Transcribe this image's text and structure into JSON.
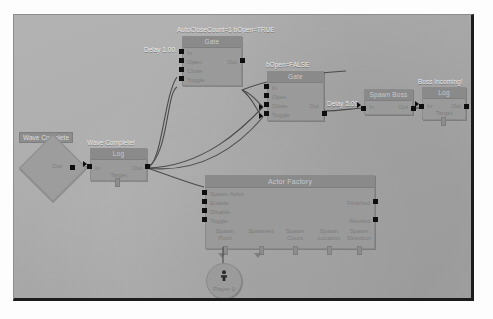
{
  "app": {
    "title": "Kismet Visual Script Graph",
    "canvas_bg": "#a8a8a8",
    "node_bg": "#9a9a9a",
    "node_header_bg": "#8a8a8a",
    "pin_color": "#0e0e0e",
    "wire_color": "#4b4b4b",
    "label_color": "#e9e9e9"
  },
  "comments": {
    "auto_close": "AutoCloseCount=1 bOpen=TRUE",
    "bopen_false": "bOpen=FALSE",
    "delay_1": "Delay 1.00",
    "delay_5": "Delay 5.00",
    "boss_incoming": "Boss Incoming!",
    "wave_complete_log": "Wave Complete!",
    "wave_complete_event": "Wave Complete"
  },
  "nodes": {
    "wave_complete_event": {
      "title": "Wave Complete",
      "out_label": "Out"
    },
    "wave_complete_log": {
      "title": "Log",
      "comment": "Wave Complete!",
      "in_label": "In",
      "out_label": "Out",
      "target_label": "Target"
    },
    "gate_a": {
      "title": "Gate",
      "comment": "AutoCloseCount=1 bOpen=TRUE",
      "inputs": [
        "In",
        "Open",
        "Close",
        "Toggle"
      ],
      "out_label": "Out"
    },
    "gate_b": {
      "title": "Gate",
      "comment": "bOpen=FALSE",
      "inputs": [
        "In",
        "Open",
        "Close",
        "Toggle"
      ],
      "out_label": "Out"
    },
    "spawn_boss": {
      "title": "Spawn Boss",
      "in_label": "In",
      "out_label": "Out"
    },
    "boss_log": {
      "title": "Log",
      "comment": "Boss Incoming!",
      "in_label": "In",
      "out_label": "Out",
      "target_label": "Target"
    },
    "actor_factory": {
      "title": "Actor Factory",
      "inputs": [
        "Spawn Actor",
        "Enable",
        "Disable",
        "Toggle"
      ],
      "outputs": [
        "Finished",
        "Aborted"
      ],
      "variables": [
        "Spawn Point",
        "Spawned",
        "Spawn Count",
        "Spawn Location",
        "Spawn Direction"
      ]
    },
    "player_var": {
      "label": "Player 0"
    }
  }
}
